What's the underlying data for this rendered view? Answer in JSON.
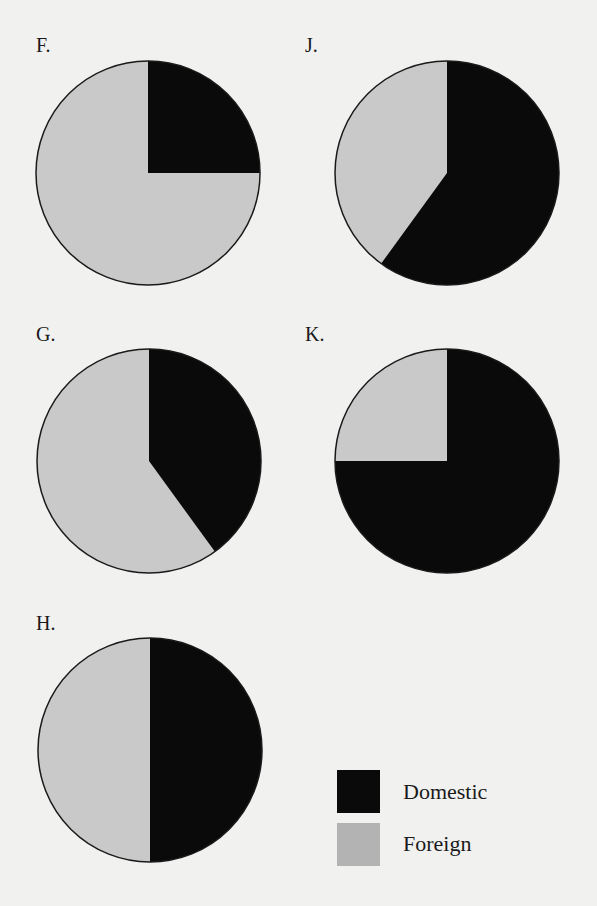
{
  "colors": {
    "domestic": "#0a0a0a",
    "foreign": "#c9c9c9",
    "outline": "#1a1a1a",
    "background": "#f1f1f0"
  },
  "legend": {
    "domestic_label": "Domestic",
    "foreign_label": "Foreign"
  },
  "charts": [
    {
      "id": "F",
      "label": "F.",
      "domestic_pct": 25,
      "foreign_pct": 75
    },
    {
      "id": "J",
      "label": "J.",
      "domestic_pct": 60,
      "foreign_pct": 40
    },
    {
      "id": "G",
      "label": "G.",
      "domestic_pct": 40,
      "foreign_pct": 60
    },
    {
      "id": "K",
      "label": "K.",
      "domestic_pct": 75,
      "foreign_pct": 25
    },
    {
      "id": "H",
      "label": "H.",
      "domestic_pct": 50,
      "foreign_pct": 50
    }
  ],
  "chart_data": {
    "type": "pie",
    "title": "",
    "legend": [
      "Domestic",
      "Foreign"
    ],
    "legend_position": "bottom-right",
    "charts": [
      {
        "label": "F.",
        "categories": [
          "Domestic",
          "Foreign"
        ],
        "values": [
          25,
          75
        ]
      },
      {
        "label": "J.",
        "categories": [
          "Domestic",
          "Foreign"
        ],
        "values": [
          60,
          40
        ]
      },
      {
        "label": "G.",
        "categories": [
          "Domestic",
          "Foreign"
        ],
        "values": [
          40,
          60
        ]
      },
      {
        "label": "K.",
        "categories": [
          "Domestic",
          "Foreign"
        ],
        "values": [
          75,
          25
        ]
      },
      {
        "label": "H.",
        "categories": [
          "Domestic",
          "Foreign"
        ],
        "values": [
          50,
          50
        ]
      }
    ]
  }
}
